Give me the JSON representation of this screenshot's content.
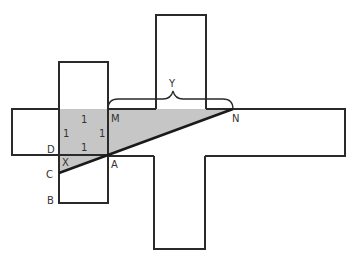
{
  "diagram": {
    "points": {
      "M": {
        "label": "M",
        "x": 108,
        "y": 109
      },
      "N": {
        "label": "N",
        "x": 233,
        "y": 109
      },
      "A": {
        "label": "A",
        "x": 108,
        "y": 155
      },
      "D": {
        "label": "D",
        "x": 59,
        "y": 155
      },
      "C": {
        "label": "C",
        "x": 59,
        "y": 173
      },
      "B": {
        "label": "B",
        "x": 59,
        "y": 203
      },
      "X": {
        "label": "X"
      }
    },
    "square_side_labels": [
      "1",
      "1",
      "1",
      "1"
    ],
    "brace_label": "Y",
    "colors": {
      "stroke": "#2a2a2a",
      "shade": "#c6c6c6"
    }
  }
}
